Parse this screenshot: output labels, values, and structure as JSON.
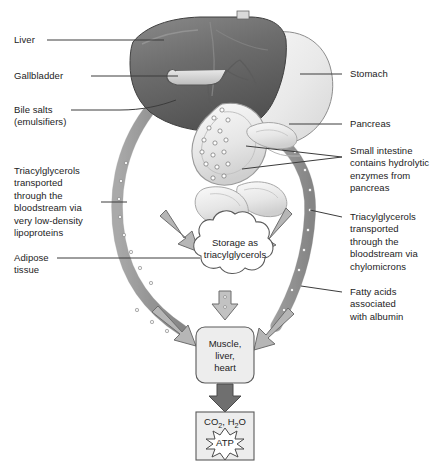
{
  "figure": {
    "type": "biological-flow-diagram"
  },
  "colors": {
    "liver": "#6f6f6f",
    "liver_dark": "#5a5a5a",
    "stomach": "#ececec",
    "intestine": "#e4e4e4",
    "vessel": "#a8a8a8",
    "arrow_light": "#b4b4b4",
    "arrow_dark": "#7c7c7c",
    "box_fill": "#ededed",
    "outline": "#4a4a4a",
    "text": "#1c1c1c",
    "background": "#ffffff"
  },
  "labels": {
    "left": [
      {
        "id": "liver",
        "text": "Liver"
      },
      {
        "id": "gallbladder",
        "text": "Gallbladder"
      },
      {
        "id": "bile-salts",
        "text": "Bile salts\n(emulsifiers)"
      },
      {
        "id": "vldl",
        "text": "Triacylglycerols\ntransported\nthrough the\nbloodstream via\nvery low-density\nlipoproteins"
      },
      {
        "id": "adipose",
        "text": "Adipose\ntissue"
      }
    ],
    "right": [
      {
        "id": "stomach",
        "text": "Stomach"
      },
      {
        "id": "pancreas",
        "text": "Pancreas"
      },
      {
        "id": "small-intestine",
        "text": "Small intestine\ncontains hydrolytic\nenzymes from\npancreas"
      },
      {
        "id": "chylomicrons",
        "text": "Triacylglycerols\ntransported\nthrough the\nbloodstream via\nchylomicrons"
      },
      {
        "id": "fatty-acids",
        "text": "Fatty acids\nassociated\nwith albumin"
      }
    ]
  },
  "nodes": {
    "storage": {
      "text": "Storage as\ntriacylglycerols",
      "shape": "cloud"
    },
    "tissues": {
      "text": "Muscle,\nliver,\nheart",
      "shape": "rounded-box"
    },
    "products": {
      "formula_co2": "CO",
      "formula_co2_sub": "2",
      "formula_sep": ", H",
      "formula_h2o_sub": "2",
      "formula_o": "O",
      "burst_label": "ATP",
      "shape": "box-with-starburst"
    }
  },
  "anatomy": {
    "liver": "liver-organ",
    "falciform": "falciform-tab",
    "gallbladder": "gallbladder-organ",
    "stomach": "stomach-organ",
    "duodenum": "duodenum-loop",
    "pancreas": "pancreas-organ",
    "small_intestine": "small-intestine-coils",
    "vessel_left": "vldl-vessel",
    "vessel_right": "chylomicron-vessel"
  }
}
